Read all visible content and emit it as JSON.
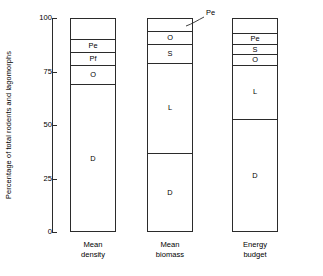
{
  "chart_data": {
    "type": "bar",
    "title": "",
    "subtitle": "",
    "xlabel": "",
    "ylabel": "Percentage of total rodents and lagomorphs",
    "ylim": [
      0,
      100
    ],
    "yticks": [
      "0",
      "25",
      "50",
      "75",
      "100"
    ],
    "ytick_values": [
      0,
      25,
      50,
      75,
      100
    ],
    "grid": false,
    "legend": "none",
    "stacked": true,
    "categories": [
      "Mean density",
      "Mean biomass",
      "Energy budget"
    ],
    "category_labels": [
      {
        "line1": "Mean",
        "line2": "density"
      },
      {
        "line1": "Mean",
        "line2": "biomass"
      },
      {
        "line1": "Energy",
        "line2": "budget"
      }
    ],
    "segment_keys": [
      "blank",
      "Pe",
      "Pf",
      "S",
      "O",
      "L",
      "D"
    ],
    "series": [
      {
        "name": "Mean density",
        "segments": [
          {
            "label": "",
            "from": 90,
            "to": 100,
            "value": 10
          },
          {
            "label": "Pe",
            "from": 84,
            "to": 90,
            "value": 6
          },
          {
            "label": "Pf",
            "from": 78,
            "to": 84,
            "value": 6
          },
          {
            "label": "O",
            "from": 69,
            "to": 78,
            "value": 9
          },
          {
            "label": "D",
            "from": 0,
            "to": 69,
            "value": 69
          }
        ]
      },
      {
        "name": "Mean biomass",
        "segments": [
          {
            "label": "",
            "from": 94,
            "to": 100,
            "value": 6
          },
          {
            "label": "O",
            "from": 88,
            "to": 94,
            "value": 6
          },
          {
            "label": "S",
            "from": 79,
            "to": 88,
            "value": 9
          },
          {
            "label": "L",
            "from": 37,
            "to": 79,
            "value": 42
          },
          {
            "label": "D",
            "from": 0,
            "to": 37,
            "value": 37
          }
        ]
      },
      {
        "name": "Energy budget",
        "segments": [
          {
            "label": "",
            "from": 93,
            "to": 100,
            "value": 7
          },
          {
            "label": "Pe",
            "from": 88,
            "to": 93,
            "value": 5
          },
          {
            "label": "S",
            "from": 83,
            "to": 88,
            "value": 5
          },
          {
            "label": "O",
            "from": 78,
            "to": 83,
            "value": 5
          },
          {
            "label": "L",
            "from": 53,
            "to": 78,
            "value": 25
          },
          {
            "label": "D",
            "from": 0,
            "to": 53,
            "value": 53
          }
        ]
      }
    ],
    "annotations": [
      {
        "text": "Pe",
        "target_series": "Mean biomass",
        "target_segment_index": 0
      }
    ],
    "colors": {
      "axis": "#2b2b2b",
      "bar_fill": "#ffffff",
      "bar_stroke": "#2b2b2b",
      "text": "#000000"
    }
  }
}
